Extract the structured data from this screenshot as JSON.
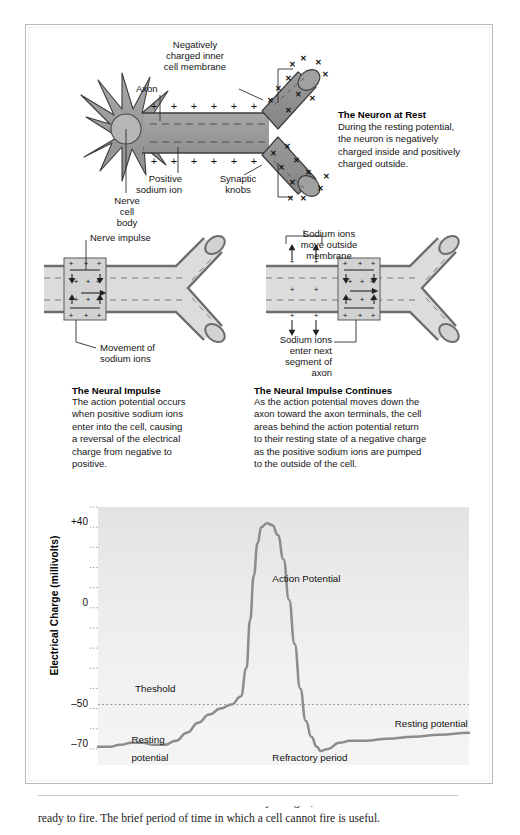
{
  "figure": {
    "panel_rest": {
      "title": "The Neuron at Rest",
      "body": "During the resting potential,\nthe neuron is negatively\ncharged inside and positively\ncharged outside.",
      "labels": {
        "axon": "Axon",
        "negative_membrane": "Negatively\ncharged inner\ncell membrane",
        "positive_sodium": "Positive\nsodium ion",
        "synaptic_knobs": "Synaptic\nknobs",
        "nerve_cell_body": "Nerve\ncell\nbody"
      },
      "charge_inside": "–",
      "charge_outside": "+",
      "outside_ion_mark": "✕"
    },
    "panel_impulse": {
      "title": "The Neural Impulse",
      "body": "The action potential occurs\nwhen positive sodium ions\nenter into the cell, causing\na reversal of the electrical\ncharge from negative to\npositive.",
      "labels": {
        "nerve_impulse": "Nerve impulse",
        "movement_of_sodium": "Movement of\nsodium ions"
      }
    },
    "panel_continues": {
      "title": "The Neural Impulse Continues",
      "body": "As the action potential moves down the\naxon toward the axon terminals, the cell\nareas behind the action potential return\nto their resting state of a negative charge\nas the positive sodium ions are pumped\nto the outside of the cell.",
      "labels": {
        "ions_move_outside": "Sodium ions\nmove outside\nmembrane",
        "ions_enter_next": "Sodium ions\nenter next\nsegment of\naxon"
      }
    }
  },
  "chart_data": {
    "type": "line",
    "title": "",
    "xlabel": "",
    "ylabel": "Electrical Charge (millivolts)",
    "ylim": [
      -80,
      48
    ],
    "yticks": [
      40,
      0,
      -50,
      -70
    ],
    "ytick_labels": [
      "+40",
      "0",
      "–50",
      "–70"
    ],
    "grid": false,
    "threshold_value": -50,
    "threshold_label": "Theshold",
    "annotations": [
      {
        "text": "Action Potential",
        "x": 0.47,
        "y": 12
      },
      {
        "text": "Theshold",
        "x": 0.1,
        "y": -43
      },
      {
        "text": "Resting",
        "x": 0.09,
        "y": -68
      },
      {
        "text": "potential",
        "x": 0.09,
        "y": -77
      },
      {
        "text": "Refractory period",
        "x": 0.47,
        "y": -77
      },
      {
        "text": "Resting potential",
        "x": 0.8,
        "y": -60
      }
    ],
    "series": [
      {
        "name": "Membrane potential",
        "x": [
          0.0,
          0.03,
          0.06,
          0.09,
          0.12,
          0.15,
          0.18,
          0.21,
          0.24,
          0.27,
          0.3,
          0.33,
          0.36,
          0.385,
          0.4,
          0.41,
          0.42,
          0.43,
          0.44,
          0.455,
          0.47,
          0.485,
          0.5,
          0.515,
          0.53,
          0.545,
          0.56,
          0.575,
          0.59,
          0.6,
          0.62,
          0.65,
          0.68,
          0.72,
          0.78,
          0.85,
          0.92,
          1.0
        ],
        "y": [
          -71,
          -71,
          -70,
          -69,
          -69,
          -70,
          -70,
          -68,
          -64,
          -59,
          -55,
          -52,
          -50,
          -46,
          -32,
          -8,
          14,
          30,
          38,
          40,
          39,
          34,
          22,
          2,
          -20,
          -42,
          -58,
          -66,
          -71,
          -73,
          -72,
          -69,
          -68,
          -68,
          -67,
          -66,
          -65,
          -64
        ]
      }
    ]
  },
  "page_text": {
    "clipped_line_1": "ions and a balance once more. When a cell is fully charged, it is said to be",
    "clipped_line_2": "ready to fire. The brief period of time in which a cell cannot fire is useful."
  }
}
